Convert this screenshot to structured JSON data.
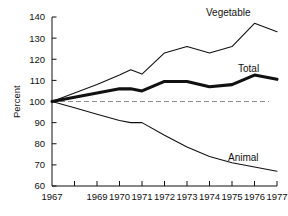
{
  "chart_data": {
    "type": "line",
    "title": "",
    "subtitle": "",
    "xlabel": "",
    "ylabel": "Percent",
    "ylim": [
      60,
      140
    ],
    "xlim": [
      1967,
      1977
    ],
    "grid": false,
    "legend_position": "inline-right-of-line-ends",
    "yticks": [
      60,
      70,
      80,
      90,
      100,
      110,
      120,
      130,
      140
    ],
    "ytick_labels": [
      "60",
      "70",
      "80",
      "90",
      "100",
      "110",
      "120",
      "130",
      "140"
    ],
    "xticks": [
      1967,
      1968,
      1969,
      1970,
      1971,
      1972,
      1973,
      1974,
      1975,
      1976,
      1977
    ],
    "xtick_labels": [
      "1967",
      "",
      "1969",
      "1970",
      "1971",
      "1972",
      "1973",
      "1974",
      "1975",
      "1976",
      "1977"
    ],
    "reference_line": {
      "value": 100,
      "style": "dashed",
      "color": "#8c8c8c"
    },
    "x": [
      1967,
      1968,
      1969,
      1970,
      1970.5,
      1971,
      1972,
      1973,
      1974,
      1975,
      1976,
      1977
    ],
    "series": [
      {
        "name": "Vegetable",
        "label": "Vegetable",
        "color": "#111111",
        "width": "thin",
        "x": [
          1967,
          1968,
          1969,
          1970,
          1970.5,
          1971,
          1972,
          1973,
          1974,
          1975,
          1976,
          1977
        ],
        "values": [
          100,
          104,
          108,
          112.5,
          115,
          113,
          123,
          126,
          123,
          126,
          137,
          133
        ]
      },
      {
        "name": "Total",
        "label": "Total",
        "color": "#111111",
        "width": "thick",
        "x": [
          1967,
          1968,
          1969,
          1970,
          1970.5,
          1971,
          1972,
          1973,
          1974,
          1975,
          1976,
          1977
        ],
        "values": [
          100,
          102,
          104,
          106,
          106,
          105,
          109.5,
          109.5,
          107,
          108,
          112.5,
          110.5
        ]
      },
      {
        "name": "Animal",
        "label": "Animal",
        "color": "#111111",
        "width": "thin",
        "x": [
          1967,
          1968,
          1969,
          1970,
          1970.5,
          1971,
          1972,
          1973,
          1974,
          1975,
          1976,
          1977
        ],
        "values": [
          100,
          97,
          94,
          91,
          90,
          90,
          84,
          78.5,
          74,
          71,
          69,
          67
        ]
      }
    ]
  },
  "labels": {
    "vegetable": "Vegetable",
    "total": "Total",
    "animal": "Animal",
    "y_axis_title": "Percent"
  }
}
